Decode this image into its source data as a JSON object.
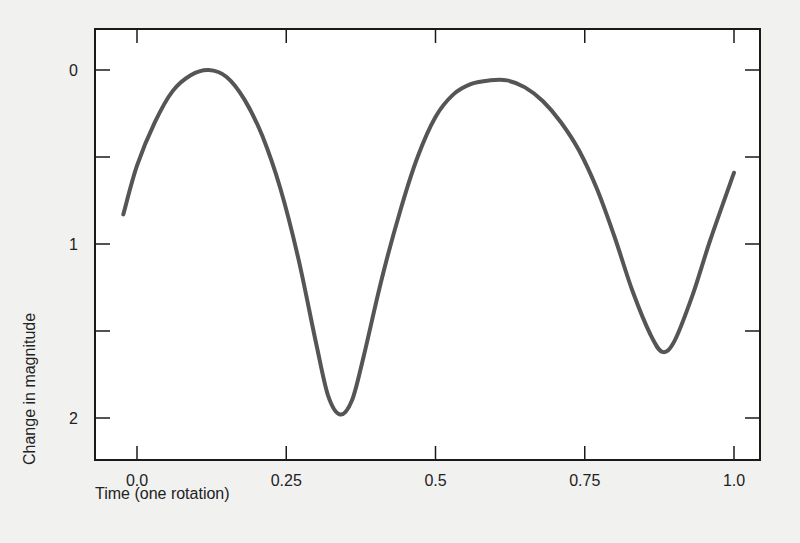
{
  "chart_data": {
    "type": "line",
    "title": "",
    "xlabel": "Time (one rotation)",
    "ylabel": "Change in magnitude",
    "x_ticks": [
      "0.0",
      "0.25",
      "0.5",
      "0.75",
      "1.0"
    ],
    "x_tick_values": [
      0.0,
      0.25,
      0.5,
      0.75,
      1.0
    ],
    "y_ticks": [
      "0",
      "1",
      "2"
    ],
    "y_tick_values": [
      0,
      1,
      2
    ],
    "y_minor_ticks": [
      0.5,
      1.5
    ],
    "xlim": [
      -0.07,
      1.04
    ],
    "ylim": [
      2.25,
      -0.23
    ],
    "y_inverted": true,
    "grid": false,
    "legend": null,
    "line_color": "#555555",
    "series": [
      {
        "name": "light curve",
        "x": [
          -0.023,
          0.0,
          0.03,
          0.06,
          0.09,
          0.12,
          0.15,
          0.18,
          0.21,
          0.24,
          0.27,
          0.3,
          0.32,
          0.34,
          0.36,
          0.38,
          0.41,
          0.44,
          0.47,
          0.5,
          0.53,
          0.56,
          0.59,
          0.62,
          0.65,
          0.68,
          0.71,
          0.74,
          0.77,
          0.8,
          0.83,
          0.86,
          0.88,
          0.9,
          0.93,
          0.96,
          1.0
        ],
        "y": [
          0.83,
          0.55,
          0.3,
          0.12,
          0.03,
          0.0,
          0.04,
          0.17,
          0.38,
          0.68,
          1.08,
          1.57,
          1.87,
          1.98,
          1.9,
          1.64,
          1.2,
          0.82,
          0.5,
          0.27,
          0.14,
          0.08,
          0.06,
          0.06,
          0.1,
          0.18,
          0.3,
          0.46,
          0.68,
          0.96,
          1.27,
          1.52,
          1.62,
          1.56,
          1.3,
          0.98,
          0.59
        ]
      }
    ]
  }
}
